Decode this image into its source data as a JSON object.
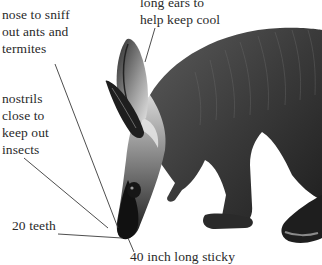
{
  "diagram": {
    "labels": {
      "nose": "nose to sniff\nout ants and\ntermites",
      "nostrils": "nostrils\nclose to\nkeep out\ninsects",
      "ears": "long ears to\nhelp keep cool",
      "teeth": "20 teeth",
      "bottom_cut": "40 inch long sticky"
    },
    "colors": {
      "text": "#2a2a2a",
      "leader_line": "#3a3a3a",
      "animal_dark": "#1c1c1c",
      "animal_mid": "#4a4a4a",
      "animal_light": "#9a9a9a",
      "background": "#ffffff"
    }
  }
}
